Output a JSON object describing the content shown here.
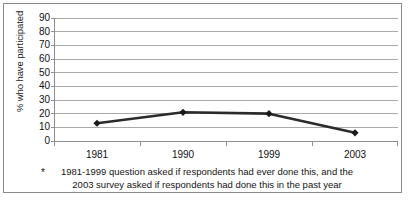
{
  "chart_data": {
    "type": "line",
    "title": "",
    "subtitle": "",
    "xlabel": "",
    "ylabel": "% who have participated",
    "categories": [
      "1981",
      "1990",
      "1999",
      "2003"
    ],
    "values": [
      13,
      21,
      20,
      6
    ],
    "series": [
      {
        "name": "% who have participated",
        "values": [
          13,
          21,
          20,
          6
        ]
      }
    ],
    "ylim": [
      0,
      90
    ],
    "y_ticks": [
      0,
      10,
      20,
      30,
      40,
      50,
      60,
      70,
      80,
      90
    ],
    "y_tick_labels": [
      "0",
      "10",
      "20",
      "30",
      "40",
      "50",
      "60",
      "70",
      "80",
      "90"
    ],
    "grid": true,
    "grid_axis": "y",
    "legend": false,
    "legend_position": "none",
    "marker": "diamond",
    "line_color": "#2b2b2b",
    "marker_color": "#1a1a1a",
    "gridline_color": "#a9a9a9",
    "axis_color": "#8f8f8f",
    "background_color": "#ffffff",
    "annotations": [
      "* 1981-1999 question asked if respondents had ever done this, and the 2003 survey asked if respondents had done this in the past year"
    ]
  },
  "footnote": {
    "marker": "*",
    "line1": "1981-1999 question asked if respondents had ever done this, and the",
    "line2": "2003 survey asked if respondents had done this in the past year"
  }
}
